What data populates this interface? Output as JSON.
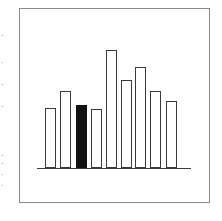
{
  "chart_data": {
    "type": "bar",
    "title": "",
    "xlabel": "",
    "ylabel": "",
    "categories": [
      "1",
      "2",
      "3",
      "4",
      "5",
      "6",
      "7",
      "8",
      "9"
    ],
    "values": [
      60,
      77,
      63,
      59,
      118,
      88,
      101,
      77,
      67
    ],
    "highlighted_index": 2,
    "ylim": [
      0,
      130
    ],
    "grid": false,
    "legend": null,
    "axes_ticks": false,
    "colors": {
      "bar_fill": "#ffffff",
      "bar_outline": "#3a3a3a",
      "highlight_fill": "#111111",
      "baseline": "#3a3a3a",
      "frame": "#8a8a8a",
      "background": "#ffffff"
    }
  },
  "layout": {
    "baseline_y": 168,
    "baseline_x_start": 37,
    "baseline_x_end": 191,
    "bar_width": 10,
    "bar_x": [
      45,
      60,
      76,
      91,
      106,
      121,
      135,
      150,
      166
    ],
    "px_per_unit": 1
  }
}
